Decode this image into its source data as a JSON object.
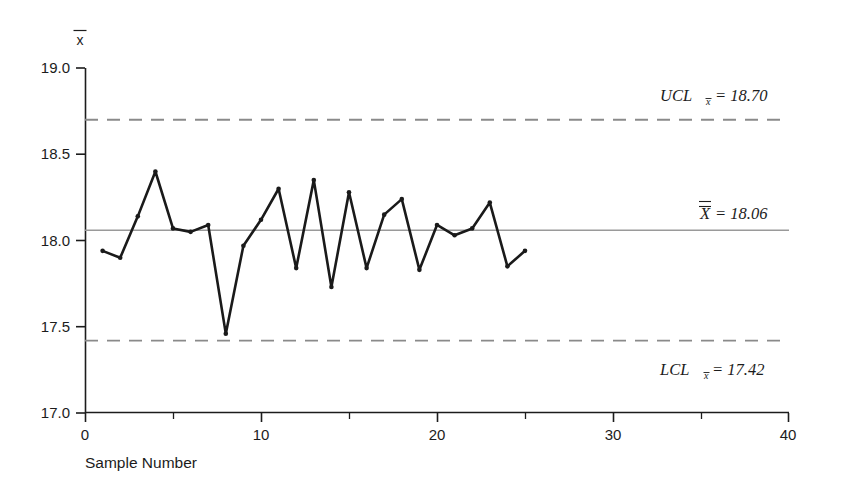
{
  "chart_data": {
    "type": "line",
    "title": "",
    "subtitle": "",
    "xlabel": "Sample Number",
    "ylabel": "x̄",
    "xlim": [
      0,
      40
    ],
    "ylim": [
      17.0,
      19.0
    ],
    "grid": false,
    "legend_position": "none",
    "x_ticks_major": [
      0,
      10,
      20,
      30,
      40
    ],
    "x_tick_labels": [
      "0",
      "10",
      "20",
      "30",
      "40"
    ],
    "x_ticks_minor": [
      5,
      15,
      25,
      35
    ],
    "y_ticks_major": [
      17.0,
      17.5,
      18.0,
      18.5,
      19.0
    ],
    "y_tick_labels": [
      "17.0",
      "17.5",
      "18.0",
      "18.5",
      "19.0"
    ],
    "series": [
      {
        "name": "Sample mean",
        "marker": "dot",
        "x": [
          1,
          2,
          3,
          4,
          5,
          6,
          7,
          8,
          9,
          10,
          11,
          12,
          13,
          14,
          15,
          16,
          17,
          18,
          19,
          20,
          21,
          22,
          23,
          24,
          25
        ],
        "values": [
          17.94,
          17.9,
          18.14,
          18.4,
          18.07,
          18.05,
          18.09,
          17.46,
          17.97,
          18.12,
          18.3,
          17.84,
          18.35,
          17.73,
          18.28,
          17.84,
          18.15,
          18.24,
          17.83,
          18.09,
          18.03,
          18.07,
          18.22,
          17.85,
          17.94
        ]
      }
    ],
    "control_lines": [
      {
        "name": "UCL",
        "value": 18.7,
        "style": "dashed",
        "label": "UCL",
        "label_subscript": "x̄",
        "label_text": "= 18.70"
      },
      {
        "name": "center",
        "value": 18.06,
        "style": "solid",
        "label": "X̄̄",
        "label_subscript": "",
        "label_text": "= 18.06"
      },
      {
        "name": "LCL",
        "value": 17.42,
        "style": "dashed",
        "label": "LCL",
        "label_subscript": "x̄",
        "label_text": "= 17.42"
      }
    ]
  },
  "labels": {
    "y_axis_symbol": "x",
    "x_axis_title": "Sample Number",
    "ucl_name": "UCL",
    "ucl_sub": "x",
    "ucl_value": "= 18.70",
    "center_value": "= 18.06",
    "lcl_name": "LCL",
    "lcl_sub": "x",
    "lcl_value": "= 17.42",
    "ytick_0": "17.0",
    "ytick_1": "17.5",
    "ytick_2": "18.0",
    "ytick_3": "18.5",
    "ytick_4": "19.0",
    "xtick_0": "0",
    "xtick_1": "10",
    "xtick_2": "20",
    "xtick_3": "30",
    "xtick_4": "40"
  },
  "colors": {
    "axis": "#1c1c1c",
    "data_line": "#1a1a1a",
    "control_dashed": "#8a8a8a",
    "center_line": "#9a9a9a",
    "background": "#ffffff"
  }
}
